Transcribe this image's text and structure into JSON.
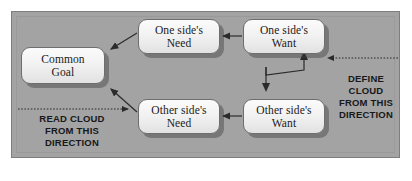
{
  "diagram": {
    "type": "conflict-resolution-diagram",
    "panel_color": "#a3a3a3",
    "box_fill_color": "#f2f2f2",
    "box_border_color": "#6e6e6e",
    "line_color": "#2b2b2b",
    "text_color": "#1a1a1a",
    "boxes": [
      {
        "id": "common-goal",
        "label": "Common\nGoal"
      },
      {
        "id": "one-need",
        "label": "One side's\nNeed"
      },
      {
        "id": "one-want",
        "label": "One side's\nWant"
      },
      {
        "id": "other-need",
        "label": "Other side's\nNeed"
      },
      {
        "id": "other-want",
        "label": "Other side's\nWant"
      }
    ],
    "captions": [
      {
        "id": "read-direction",
        "text": "READ CLOUD\nFROM THIS\nDIRECTION"
      },
      {
        "id": "define-direction",
        "text": "DEFINE\nCLOUD\nFROM THIS\nDIRECTION"
      }
    ],
    "connections": [
      {
        "from": "one-need",
        "to": "common-goal",
        "style": "solid"
      },
      {
        "from": "other-need",
        "to": "common-goal",
        "style": "solid"
      },
      {
        "from": "one-want",
        "to": "one-need",
        "style": "solid"
      },
      {
        "from": "other-want",
        "to": "other-need",
        "style": "solid"
      },
      {
        "from": "one-want",
        "to": "other-want",
        "style": "conflict"
      },
      {
        "from": "define-direction",
        "to": "one-want",
        "style": "dotted"
      },
      {
        "from": "read-direction",
        "to": "other-need",
        "style": "dotted"
      }
    ]
  }
}
